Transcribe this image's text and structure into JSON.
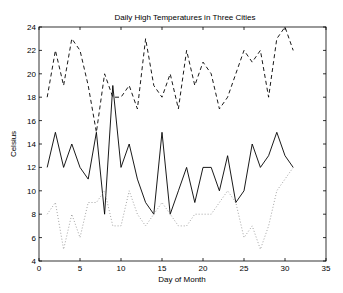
{
  "chart_data": {
    "type": "line",
    "title": "Daily High Temperatures in Three Cities",
    "xlabel": "Day of Month",
    "ylabel": "Celsius",
    "xlim": [
      0,
      35
    ],
    "ylim": [
      4,
      24
    ],
    "xticks": [
      0,
      5,
      10,
      15,
      20,
      25,
      30,
      35
    ],
    "yticks": [
      4,
      6,
      8,
      10,
      12,
      14,
      16,
      18,
      20,
      22,
      24
    ],
    "grid": false,
    "legend": null,
    "x": [
      1,
      2,
      3,
      4,
      5,
      6,
      7,
      8,
      9,
      10,
      11,
      12,
      13,
      14,
      15,
      16,
      17,
      18,
      19,
      20,
      21,
      22,
      23,
      24,
      25,
      26,
      27,
      28,
      29,
      30,
      31
    ],
    "series": [
      {
        "name": "City 1 (dashed)",
        "style": "dashed",
        "color": "#000000",
        "values": [
          18,
          22,
          19,
          23,
          22,
          19,
          15,
          20,
          18,
          18,
          19,
          17,
          23,
          19,
          18,
          20,
          17,
          22,
          19,
          21,
          20,
          17,
          18,
          20,
          22,
          21,
          22,
          18,
          23,
          24,
          22
        ]
      },
      {
        "name": "City 2 (solid)",
        "style": "solid",
        "color": "#000000",
        "values": [
          12,
          15,
          12,
          14,
          12,
          11,
          15,
          8,
          19,
          12,
          14,
          11,
          9,
          8,
          15,
          8,
          10,
          12,
          9,
          12,
          12,
          10,
          13,
          9,
          10,
          14,
          12,
          13,
          15,
          13,
          12
        ]
      },
      {
        "name": "City 3 (dotted)",
        "style": "dotted",
        "color": "#999999",
        "values": [
          8,
          9,
          5,
          8,
          6,
          9,
          9,
          10,
          7,
          7,
          10,
          8,
          7,
          8,
          9,
          8,
          7,
          7,
          8,
          8,
          8,
          9,
          10,
          9,
          6,
          7,
          5,
          7,
          10,
          11,
          12
        ]
      }
    ]
  }
}
